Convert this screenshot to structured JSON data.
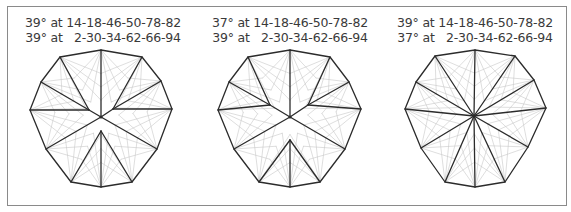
{
  "figure": {
    "panels": [
      {
        "caption_line1": "39° at 14-18-46-50-78-82",
        "caption_line2": "39° at   2-30-34-62-66-94",
        "center": [
          101,
          117
        ],
        "vertices": [
          [
            101,
            50
          ],
          [
            142,
            57
          ],
          [
            161,
            81
          ],
          [
            172,
            109
          ],
          [
            157,
            149
          ],
          [
            132,
            182
          ],
          [
            101,
            187
          ],
          [
            71,
            182
          ],
          [
            46,
            149
          ],
          [
            30,
            110
          ],
          [
            41,
            82
          ],
          [
            60,
            57
          ]
        ],
        "inner_points": {
          "left": [
            89,
            110
          ],
          "right": [
            113,
            109
          ],
          "bottom": [
            101,
            131
          ]
        }
      },
      {
        "caption_line1": "37° at 14-18-46-50-78-82",
        "caption_line2": "39° at   2-30-34-62-66-94",
        "center": [
          290,
          117
        ],
        "vertices": [
          [
            290,
            50
          ],
          [
            330,
            57
          ],
          [
            349,
            82
          ],
          [
            361,
            109
          ],
          [
            345,
            149
          ],
          [
            320,
            182
          ],
          [
            290,
            187
          ],
          [
            259,
            182
          ],
          [
            234,
            149
          ],
          [
            218,
            110
          ],
          [
            229,
            82
          ],
          [
            248,
            57
          ]
        ],
        "inner_points": {
          "left": [
            270,
            105
          ],
          "right": [
            308,
            105
          ],
          "bottom": [
            290,
            140
          ]
        }
      },
      {
        "caption_line1": "39° at 14-18-46-50-78-82",
        "caption_line2": "37° at   2-30-34-62-66-94",
        "center": [
          474,
          116
        ],
        "vertices": [
          [
            475,
            50
          ],
          [
            515,
            56
          ],
          [
            534,
            80
          ],
          [
            546,
            108
          ],
          [
            528,
            147
          ],
          [
            505,
            182
          ],
          [
            475,
            187
          ],
          [
            445,
            182
          ],
          [
            421,
            148
          ],
          [
            405,
            109
          ],
          [
            416,
            82
          ],
          [
            435,
            56
          ]
        ],
        "inner_points": null
      }
    ],
    "colors": {
      "outline": "#2b2b2b",
      "fan_lines": "#c8c8c8",
      "text": "#3a3a3a",
      "frame": "#8a8a8a"
    }
  }
}
